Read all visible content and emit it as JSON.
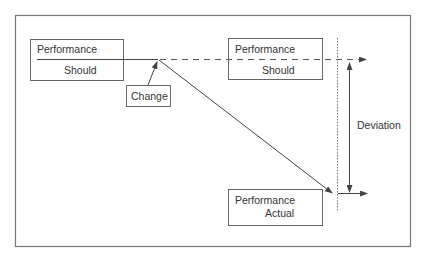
{
  "diagram": {
    "type": "performance-deviation-diagram",
    "boxes": [
      {
        "id": "should-left",
        "line1": "Performance",
        "line2": "Should"
      },
      {
        "id": "should-right",
        "line1": "Performance",
        "line2": "Should"
      },
      {
        "id": "actual",
        "line1": "Performance",
        "line2": "Actual"
      }
    ],
    "change_label": "Change",
    "deviation_label": "Deviation",
    "colors": {
      "stroke": "#555555",
      "frame": "#777777",
      "text": "#333333",
      "background": "#ffffff"
    }
  }
}
